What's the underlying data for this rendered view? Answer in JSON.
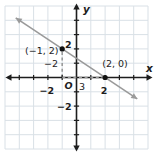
{
  "chart_data": {
    "type": "line",
    "xlabel": "x",
    "ylabel": "y",
    "origin_label": "O",
    "xlim": [
      -5,
      5
    ],
    "ylim": [
      -5,
      5
    ],
    "grid": true,
    "tick_step": 1,
    "x_tick_labels": [
      {
        "value": -2,
        "label": "−2"
      },
      {
        "value": 2,
        "label": "2"
      }
    ],
    "y_tick_labels": [
      {
        "value": 2,
        "label": "2"
      },
      {
        "value": -2,
        "label": "−2"
      }
    ],
    "points": [
      {
        "x": -1,
        "y": 2,
        "label": "(−1, 2)"
      },
      {
        "x": 2,
        "y": 0,
        "label": "(2, 0)"
      }
    ],
    "line": {
      "through": [
        [
          -1,
          2
        ],
        [
          2,
          0
        ]
      ],
      "x_start": -4.25,
      "x_end": 4.25,
      "arrows_both_ends": true
    },
    "slope_annotations": {
      "rise": {
        "label": "−2",
        "dashed_from": [
          -1,
          2
        ],
        "dashed_to": [
          -1,
          0
        ]
      },
      "run": {
        "label": "3",
        "dashed_from": [
          -1,
          0
        ],
        "dashed_to": [
          2,
          0
        ]
      }
    }
  },
  "colors": {
    "background": "#ffffff",
    "grid": "#d9e0e6",
    "axis": "#1d1d1d",
    "line": "#9a9a9a",
    "annotation": "#9b9b9b",
    "point": "#111111",
    "text": "#1d1d1d"
  }
}
